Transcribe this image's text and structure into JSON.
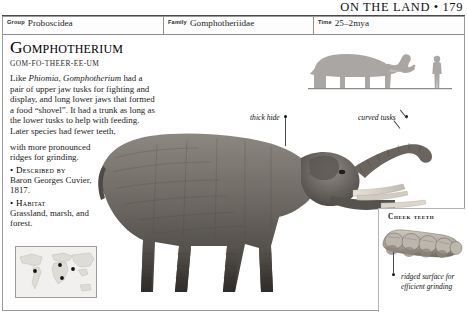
{
  "running_head": {
    "text": "ON THE LAND • 179",
    "page_number": "179",
    "section": "ON THE LAND"
  },
  "classification": {
    "fields": [
      {
        "key": "Group",
        "value": "Proboscidea"
      },
      {
        "key": "Family",
        "value": "Gomphotheriidae"
      },
      {
        "key": "Time",
        "value": "25–2mya"
      }
    ]
  },
  "entry": {
    "title": "Gomphotherium",
    "pronunciation": "GOM-FO-THEER-EE-UM",
    "description_p1": "Like ",
    "description_genus_1": "Phiomia",
    "description_p2": ", ",
    "description_genus_2": "Gomphotherium",
    "description_p3": " had a pair of upper jaw tusks for fighting and display, and long lower jaws that formed a food “shovel”. It had a trunk as long as the lower tusks to help with feeding. Later species had fewer teeth,",
    "description_narrow": "with more pronounced ridges for grinding.",
    "described_by_label": "Described by",
    "described_by_value": "Baron Georges Cuvier, 1817.",
    "habitat_label": "Habitat",
    "habitat_value": "Grassland, marsh, and forest.",
    "bullet_glyph": "•"
  },
  "annotations": {
    "thick_hide": "thick hide",
    "curved_tusks": "curved tusks"
  },
  "inset": {
    "title": "Cheek teeth",
    "caption": "ridged surface for efficient grinding"
  },
  "icons": {
    "distribution_map": "world-map-icon",
    "scale_human": "human-silhouette-icon",
    "scale_animal": "gomphotherium-silhouette-icon"
  },
  "colors": {
    "page_background": "#ffffff",
    "rule": "#4a4a4a",
    "border": "#9a9a9a",
    "text": "#1a1a1a",
    "animal_body": "#6e6a66",
    "animal_shadow": "#3b3835",
    "scale_grey": "#a8a5a2",
    "map_land": "#e3e2de",
    "tooth": "#b9b3ac"
  }
}
